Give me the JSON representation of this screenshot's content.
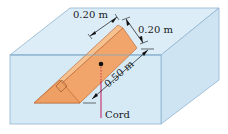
{
  "diagram": {
    "labels": {
      "top_width": "0.20 m",
      "top_depth": "0.20 m",
      "hypotenuse": "0.50 m",
      "cord": "Cord"
    },
    "colors": {
      "water_front": "#d6eaf6",
      "water_top": "#dcedf8",
      "water_side": "#cfe4f3",
      "edge": "#7fa8c8",
      "block_front": "#f2a56b",
      "block_top": "#f7c08f",
      "block_edge": "#b5602a",
      "cord": "#c2185b",
      "dot": "#111111"
    }
  }
}
